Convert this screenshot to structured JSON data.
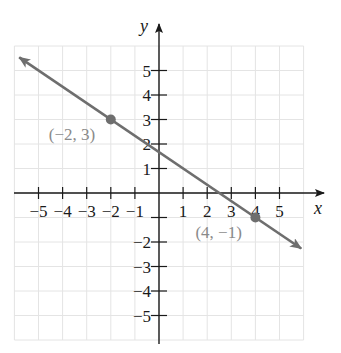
{
  "chart_data": {
    "type": "line",
    "title": "",
    "xlabel": "x",
    "ylabel": "y",
    "xlim": [
      -6,
      6
    ],
    "ylim": [
      -6,
      6
    ],
    "grid": true,
    "x_ticks": [
      -5,
      -4,
      -3,
      -2,
      -1,
      1,
      2,
      3,
      4,
      5
    ],
    "y_ticks": [
      5,
      4,
      3,
      2,
      1,
      -2,
      -3,
      -4,
      -5
    ],
    "x_tick_labels": [
      "−5",
      "−4",
      "−3",
      "−2",
      "−1",
      "1",
      "2",
      "3",
      "4",
      "5"
    ],
    "y_tick_labels": [
      "5",
      "4",
      "3",
      "2",
      "1",
      "−2",
      "−3",
      "−4",
      "−5"
    ],
    "series": [
      {
        "name": "line through (−2, 3) and (4, −1)",
        "equation": "y = -2/3 x + 5/3",
        "slope": -0.6667,
        "intercept": 1.6667,
        "x_range": [
          -6,
          6
        ],
        "arrows_both_ends": true,
        "color": "#6e6e6e"
      }
    ],
    "points": [
      {
        "x": -2,
        "y": 3,
        "label": "(−2, 3)"
      },
      {
        "x": 4,
        "y": -1,
        "label": "(4, −1)"
      }
    ],
    "colors": {
      "grid": "#e4e4e4",
      "axis": "#1a1a1a",
      "line": "#6e6e6e",
      "point": "#6e6e6e",
      "point_label": "#8a8a8a"
    }
  }
}
